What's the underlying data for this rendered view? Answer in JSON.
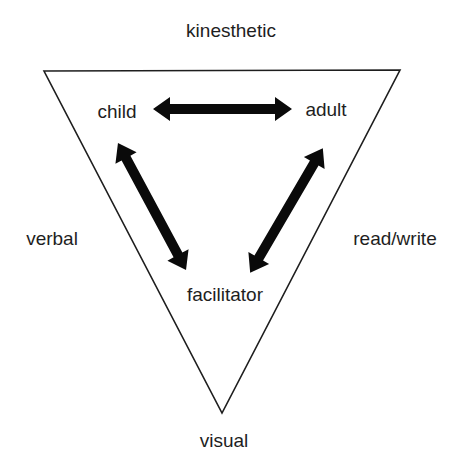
{
  "diagram": {
    "type": "triangle-relationship",
    "corner_labels": {
      "top": "kinesthetic",
      "left": "verbal",
      "right": "read/write",
      "bottom": "visual"
    },
    "node_labels": {
      "child": "child",
      "adult": "adult",
      "facilitator": "facilitator"
    },
    "relationships": [
      {
        "from": "child",
        "to": "adult",
        "direction": "bidirectional"
      },
      {
        "from": "child",
        "to": "facilitator",
        "direction": "bidirectional"
      },
      {
        "from": "adult",
        "to": "facilitator",
        "direction": "bidirectional"
      }
    ],
    "colors": {
      "line": "#1e1e1e",
      "arrow": "#0a0a0a",
      "text": "#1e1e1e",
      "background": "#ffffff"
    }
  }
}
